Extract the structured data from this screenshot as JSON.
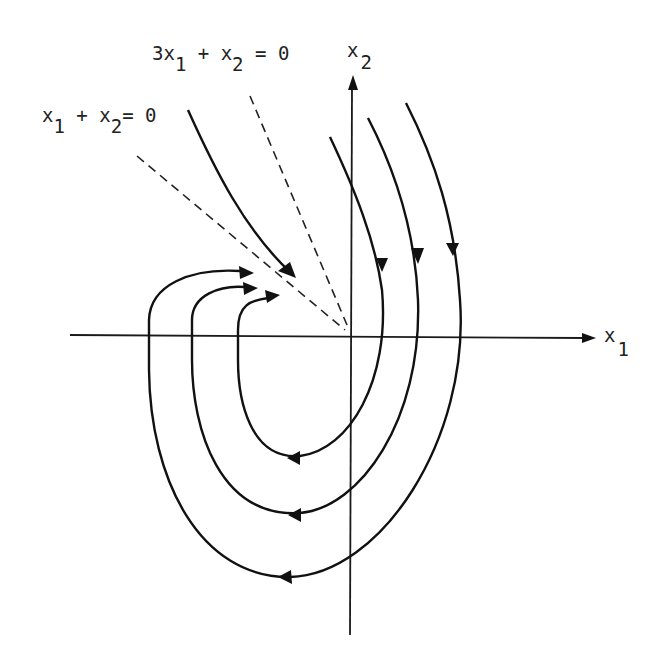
{
  "diagram": {
    "type": "phase-portrait",
    "axes": {
      "horizontal": {
        "name": "x",
        "subscript": "1"
      },
      "vertical": {
        "name": "x",
        "subscript": "2"
      }
    },
    "lines": [
      {
        "id": "line-3x1-x2",
        "label_parts": [
          "3x",
          "1",
          " + x",
          "2",
          " = 0"
        ],
        "style": "dashed"
      },
      {
        "id": "line-x1-x2",
        "label_parts": [
          "x",
          "1",
          " + x",
          "2",
          "= 0"
        ],
        "style": "dashed"
      }
    ],
    "trajectories": {
      "incoming_from_upper_left": 1,
      "u_shaped_loops": 3,
      "direction": "clockwise, approaching origin along line x1 + x2 = 0"
    },
    "colors": {
      "ink": "#111111",
      "background": "#ffffff"
    }
  }
}
